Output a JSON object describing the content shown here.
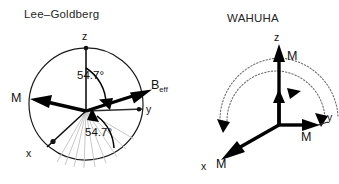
{
  "figure": {
    "background_color": "#ffffff",
    "stroke_color": "#000000",
    "fan_color": "#c2c2c2",
    "dotted_arc_color": "#6f6f6f",
    "width": 339,
    "height": 184
  },
  "panels": [
    {
      "id": "lee-goldberg",
      "title": "Lee–Goldberg",
      "axes": [
        {
          "name": "z",
          "label": "z"
        },
        {
          "name": "y",
          "label": "y"
        },
        {
          "name": "x",
          "label": "x"
        }
      ],
      "vectors": [
        {
          "name": "magnetization",
          "label": "M"
        },
        {
          "name": "effective-field",
          "label": "B",
          "subscript": "eff"
        }
      ],
      "angles": [
        {
          "name": "tilt-from-z",
          "label": "54.7°"
        },
        {
          "name": "tilt-from-xy-plane",
          "label": "54.7°"
        }
      ],
      "fan_line_count": 9
    },
    {
      "id": "wahuha",
      "title": "WAHUHA",
      "axes": [
        {
          "name": "z",
          "label": "z"
        },
        {
          "name": "y",
          "label": "y"
        },
        {
          "name": "x",
          "label": "x"
        }
      ],
      "vectors": [
        {
          "name": "magnetization-z",
          "label": "M"
        },
        {
          "name": "magnetization-y",
          "label": "M"
        },
        {
          "name": "magnetization-x",
          "label": "M"
        }
      ],
      "trajectory_arcs": 2
    }
  ]
}
